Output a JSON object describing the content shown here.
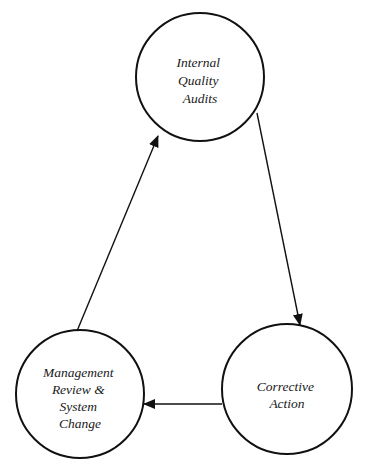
{
  "diagram": {
    "type": "cycle",
    "nodes": [
      {
        "id": "audits",
        "lines": [
          "Internal",
          "Quality",
          "Audits"
        ]
      },
      {
        "id": "corrective",
        "lines": [
          "Corrective",
          "Action"
        ]
      },
      {
        "id": "management",
        "lines": [
          "Management",
          "Review &",
          "System",
          "Change"
        ]
      }
    ],
    "edges": [
      {
        "from": "audits",
        "to": "corrective"
      },
      {
        "from": "corrective",
        "to": "management"
      },
      {
        "from": "management",
        "to": "audits"
      }
    ],
    "colors": {
      "stroke": "#111111",
      "background": "#ffffff",
      "text": "#1a1a1a"
    }
  }
}
